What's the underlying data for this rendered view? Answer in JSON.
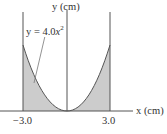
{
  "diagram": {
    "y_axis_label": "y (cm)",
    "x_axis_label": "x (cm)",
    "curve_equation_prefix": "y = 4.0",
    "curve_equation_var": "x",
    "curve_equation_exp": "2",
    "tick_left": "−3.0",
    "tick_right": "3.0",
    "colors": {
      "line": "#555555",
      "shade": "#cccccc"
    }
  }
}
